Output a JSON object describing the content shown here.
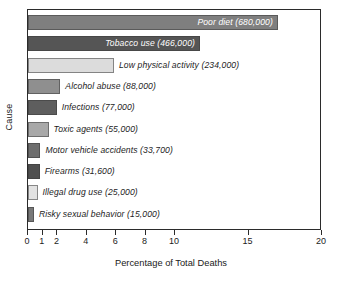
{
  "chart_data": {
    "type": "bar",
    "orientation": "horizontal",
    "title": "",
    "xlabel": "Percentage of Total Deaths",
    "ylabel": "Cause",
    "xlim": [
      0,
      20
    ],
    "xticks": [
      0,
      1,
      2,
      4,
      6,
      8,
      10,
      15,
      20
    ],
    "xticklabels": [
      "0",
      "1",
      "2",
      "4",
      "6",
      "8",
      "10",
      "15",
      "20"
    ],
    "grid": false,
    "legend": null,
    "categories": [
      "Poor diet",
      "Tobacco use",
      "Low physical activity",
      "Alcohol abuse",
      "Infections",
      "Toxic agents",
      "Motor vehicle accidents",
      "Firearms",
      "Illegal drug use",
      "Risky sexual behavior"
    ],
    "values": [
      17.0,
      11.7,
      5.85,
      2.2,
      1.95,
      1.4,
      0.85,
      0.8,
      0.65,
      0.4
    ],
    "deaths": [
      680000,
      466000,
      234000,
      88000,
      77000,
      55000,
      33700,
      31600,
      25000,
      15000
    ],
    "bars": [
      {
        "label": "Poor diet (680,000)",
        "value": 17.0,
        "deaths": "680,000",
        "color": "#7f7f7f",
        "label_inside": true
      },
      {
        "label": "Tobacco use (466,000)",
        "value": 11.7,
        "deaths": "466,000",
        "color": "#555555",
        "label_inside": true
      },
      {
        "label": "Low physical activity (234,000)",
        "value": 5.85,
        "deaths": "234,000",
        "color": "#dcdcdc",
        "label_inside": false
      },
      {
        "label": "Alcohol abuse (88,000)",
        "value": 2.2,
        "deaths": "88,000",
        "color": "#8f8f8f",
        "label_inside": false
      },
      {
        "label": "Infections (77,000)",
        "value": 1.95,
        "deaths": "77,000",
        "color": "#5e5e5e",
        "label_inside": false
      },
      {
        "label": "Toxic agents (55,000)",
        "value": 1.4,
        "deaths": "55,000",
        "color": "#a8a8a8",
        "label_inside": false
      },
      {
        "label": "Motor vehicle accidents (33,700)",
        "value": 0.85,
        "deaths": "33,700",
        "color": "#6e6e6e",
        "label_inside": false
      },
      {
        "label": "Firearms (31,600)",
        "value": 0.8,
        "deaths": "31,600",
        "color": "#4f4f4f",
        "label_inside": false
      },
      {
        "label": "Illegal drug use (25,000)",
        "value": 0.65,
        "deaths": "25,000",
        "color": "#e2e2e2",
        "label_inside": false
      },
      {
        "label": "Risky sexual behavior (15,000)",
        "value": 0.4,
        "deaths": "15,000",
        "color": "#787878",
        "label_inside": false
      }
    ]
  },
  "colors": {
    "axis": "#2b2b2b",
    "text": "#1c1c1c",
    "background": "#ffffff"
  }
}
